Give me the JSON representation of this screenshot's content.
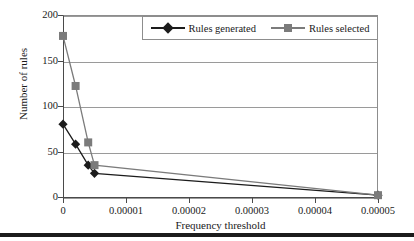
{
  "chart_data": {
    "type": "line",
    "title": "",
    "xlabel": "Frequency threshold",
    "ylabel": "Number of rules",
    "xlim": [
      0,
      5e-05
    ],
    "ylim": [
      0,
      200
    ],
    "xticks": [
      0,
      1e-05,
      2e-05,
      3e-05,
      4e-05,
      5e-05
    ],
    "xtick_labels": [
      "0",
      "0.00001",
      "0.00002",
      "0.00003",
      "0.00004",
      "0.00005"
    ],
    "yticks": [
      0,
      50,
      100,
      150,
      200
    ],
    "ytick_labels": [
      "0",
      "50",
      "100",
      "150",
      "200"
    ],
    "grid": "horizontal",
    "legend_position": "top-center",
    "series": [
      {
        "name": "Rules generated",
        "marker": "diamond",
        "color": "#1c1c1c",
        "x": [
          0,
          2e-06,
          4e-06,
          5e-06,
          5e-05
        ],
        "values": [
          80,
          58,
          35,
          26,
          2
        ]
      },
      {
        "name": "Rules selected",
        "marker": "square",
        "color": "#7b7b7b",
        "x": [
          0,
          2e-06,
          4e-06,
          5e-06,
          5e-05
        ],
        "values": [
          177,
          122,
          60,
          35,
          2
        ]
      }
    ]
  },
  "axes": {
    "x_title": "Frequency threshold",
    "y_title": "Number of rules"
  },
  "legend": {
    "entries": [
      {
        "label": "Rules generated"
      },
      {
        "label": "Rules selected"
      }
    ]
  },
  "colors": {
    "series_generated": "#1c1c1c",
    "series_selected": "#7b7b7b",
    "gridline": "#9a9a9a",
    "axis": "#4a4a4a",
    "background": "#ffffff",
    "bottom_rule": "#1c1c1c"
  }
}
